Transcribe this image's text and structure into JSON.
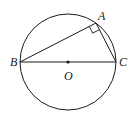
{
  "diagram": {
    "type": "geometry",
    "colors": {
      "stroke": "#1a1a1a",
      "background": "#ffffff"
    },
    "circle": {
      "center": "O",
      "cx": 68,
      "cy": 62,
      "r": 48
    },
    "points": {
      "A": {
        "label": "A",
        "x": 96,
        "y": 23
      },
      "B": {
        "label": "B",
        "x": 20,
        "y": 62
      },
      "C": {
        "label": "C",
        "x": 116,
        "y": 62
      },
      "O": {
        "label": "O",
        "x": 68,
        "y": 62
      }
    },
    "segments": [
      "BC",
      "AB",
      "AC"
    ],
    "right_angle_at": "A"
  }
}
